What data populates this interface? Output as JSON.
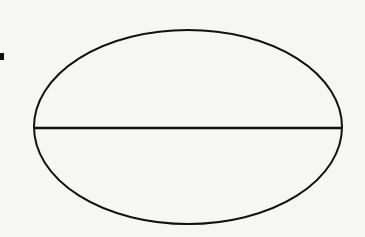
{
  "diagram": {
    "type": "ellipse-with-diameter",
    "canvas": {
      "width": 365,
      "height": 237,
      "background": "#f6f6f5"
    },
    "stroke_color": "#111111",
    "ellipse": {
      "cx": 188,
      "cy": 127,
      "rx": 154,
      "ry": 97,
      "stroke_width": 2
    },
    "diameter": {
      "x1": 34,
      "y1": 128,
      "x2": 342,
      "y2": 128,
      "stroke_width": 2.5
    },
    "marker": {
      "x": 0,
      "y": 53,
      "width": 4,
      "height": 7
    },
    "labels": []
  }
}
